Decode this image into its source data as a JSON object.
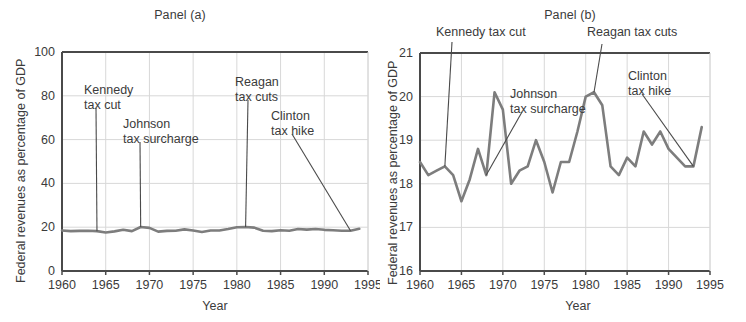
{
  "figure": {
    "xlabel": "Year",
    "ylabel": "Federal revenues as percentage of GDP",
    "line_color": "#7d7d7d",
    "grid_color": "#d8d8d8",
    "axis_color": "#4a4a4a",
    "text_color": "#3b3b3b"
  },
  "panel_a": {
    "title": "Panel (a)",
    "xlabel": "Year",
    "ylabel": "Federal revenues as percentage of GDP",
    "ytick_labels": [
      "0",
      "20",
      "40",
      "60",
      "80",
      "100"
    ],
    "xtick_labels": [
      "1960",
      "1965",
      "1970",
      "1975",
      "1980",
      "1985",
      "1990",
      "1995"
    ],
    "annotations": [
      {
        "label_line1": "Kennedy",
        "label_line2": "tax cut",
        "year": 1964
      },
      {
        "label_line1": "Johnson",
        "label_line2": "tax surcharge",
        "year": 1969
      },
      {
        "label_line1": "Reagan",
        "label_line2": "tax cuts",
        "year": 1981
      },
      {
        "label_line1": "Clinton",
        "label_line2": "tax hike",
        "year": 1993
      }
    ]
  },
  "panel_b": {
    "title": "Panel (b)",
    "xlabel": "Year",
    "ylabel": "Federal revenues as percentage of GDP",
    "ytick_labels": [
      "16",
      "17",
      "18",
      "19",
      "20",
      "21"
    ],
    "xtick_labels": [
      "1960",
      "1965",
      "1970",
      "1975",
      "1980",
      "1985",
      "1990",
      "1995"
    ],
    "annotations": [
      {
        "label_line1": "Kennedy tax cut",
        "label_line2": "",
        "year": 1963
      },
      {
        "label_line1": "Johnson",
        "label_line2": "tax surcharge",
        "year": 1968
      },
      {
        "label_line1": "Reagan tax cuts",
        "label_line2": "",
        "year": 1981
      },
      {
        "label_line1": "Clinton",
        "label_line2": "tax hike",
        "year": 1993
      }
    ]
  },
  "chart_data": [
    {
      "type": "line",
      "title": "Panel (a)",
      "xlabel": "Year",
      "ylabel": "Federal revenues as percentage of GDP",
      "xlim": [
        1960,
        1995
      ],
      "ylim": [
        0,
        100
      ],
      "yticks": [
        0,
        20,
        40,
        60,
        80,
        100
      ],
      "xticks": [
        1960,
        1965,
        1970,
        1975,
        1980,
        1985,
        1990,
        1995
      ],
      "grid": true,
      "legend": "none",
      "x": [
        1960,
        1961,
        1962,
        1963,
        1964,
        1965,
        1966,
        1967,
        1968,
        1969,
        1970,
        1971,
        1972,
        1973,
        1974,
        1975,
        1976,
        1977,
        1978,
        1979,
        1980,
        1981,
        1982,
        1983,
        1984,
        1985,
        1986,
        1987,
        1988,
        1989,
        1990,
        1991,
        1992,
        1993,
        1994
      ],
      "values": [
        18.5,
        18.2,
        18.3,
        18.4,
        18.2,
        17.6,
        18.1,
        18.8,
        18.2,
        20.1,
        19.7,
        18.0,
        18.3,
        18.4,
        19.0,
        18.5,
        17.8,
        18.5,
        18.5,
        19.2,
        20.0,
        20.1,
        19.8,
        18.4,
        18.2,
        18.6,
        18.4,
        19.2,
        18.9,
        19.2,
        18.8,
        18.6,
        18.4,
        18.4,
        19.3
      ],
      "series_note": "Same series as Panel (b), plotted on a 0-100 axis so it appears flat near 20."
    },
    {
      "type": "line",
      "title": "Panel (b)",
      "xlabel": "Year",
      "ylabel": "Federal revenues as percentage of GDP",
      "xlim": [
        1960,
        1995
      ],
      "ylim": [
        16,
        21
      ],
      "yticks": [
        16,
        17,
        18,
        19,
        20,
        21
      ],
      "xticks": [
        1960,
        1965,
        1970,
        1975,
        1980,
        1985,
        1990,
        1995
      ],
      "grid": true,
      "legend": "none",
      "x": [
        1960,
        1961,
        1962,
        1963,
        1964,
        1965,
        1966,
        1967,
        1968,
        1969,
        1970,
        1971,
        1972,
        1973,
        1974,
        1975,
        1976,
        1977,
        1978,
        1979,
        1980,
        1981,
        1982,
        1983,
        1984,
        1985,
        1986,
        1987,
        1988,
        1989,
        1990,
        1991,
        1992,
        1993,
        1994
      ],
      "values": [
        18.5,
        18.2,
        18.3,
        18.4,
        18.2,
        17.6,
        18.1,
        18.8,
        18.2,
        20.1,
        19.7,
        18.0,
        18.3,
        18.4,
        19.0,
        18.5,
        17.8,
        18.5,
        18.5,
        19.2,
        20.0,
        20.1,
        19.8,
        18.4,
        18.2,
        18.6,
        18.4,
        19.2,
        18.9,
        19.2,
        18.8,
        18.6,
        18.4,
        18.4,
        19.3
      ]
    }
  ]
}
